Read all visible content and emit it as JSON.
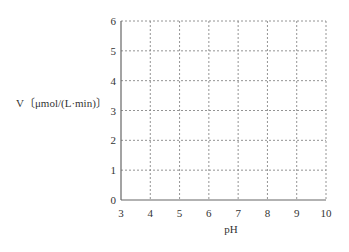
{
  "chart_data": {
    "type": "line",
    "title": "",
    "xlabel": "pH",
    "ylabel": "V〔μmol/(L·min)〕",
    "xlim": [
      3,
      10
    ],
    "ylim": [
      0,
      6
    ],
    "x_ticks": [
      "3",
      "4",
      "5",
      "6",
      "7",
      "8",
      "9",
      "10"
    ],
    "y_ticks": [
      "0",
      "1",
      "2",
      "3",
      "4",
      "5",
      "6"
    ],
    "grid": true,
    "grid_style": "dotted",
    "legend": null,
    "series": []
  },
  "colors": {
    "axis": "#666666",
    "grid": "#888888",
    "text": "#333333"
  }
}
